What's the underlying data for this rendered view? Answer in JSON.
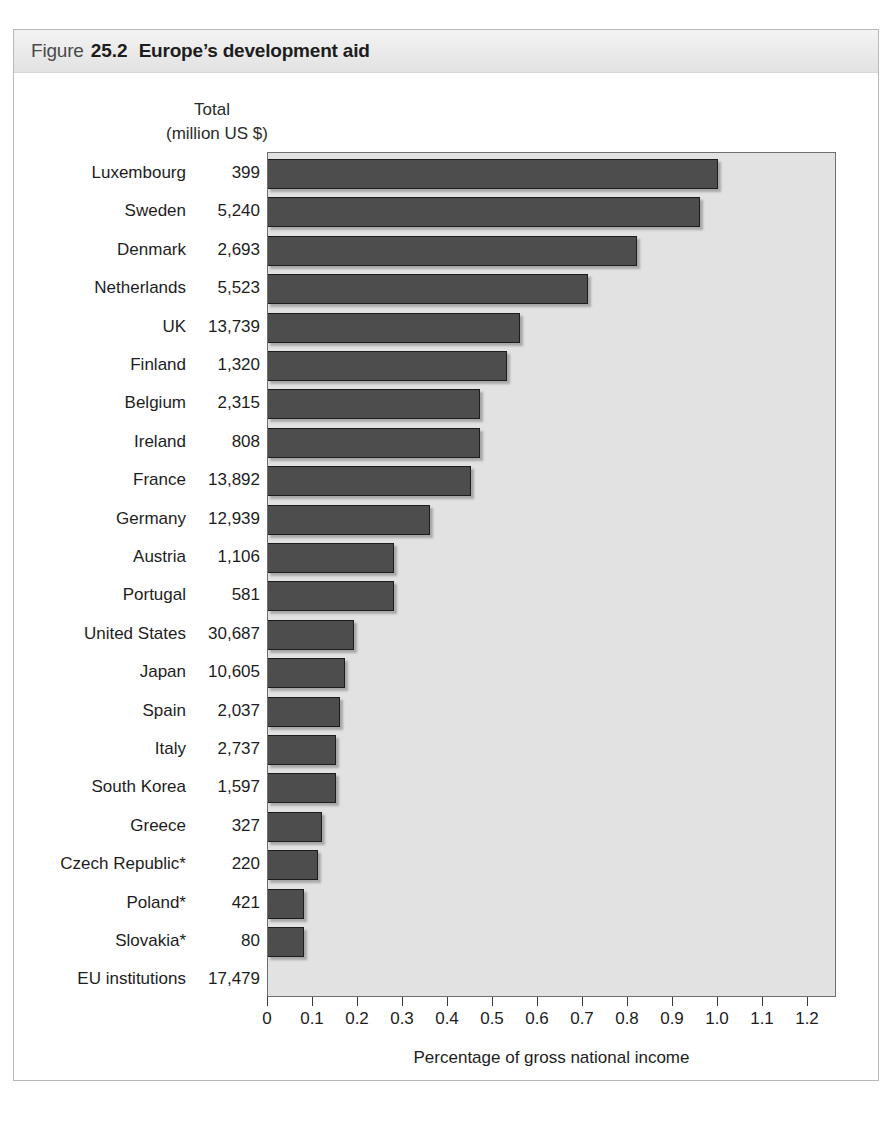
{
  "figure": {
    "label_word": "Figure",
    "number": "25.2",
    "title": "Europe’s development aid"
  },
  "columns": {
    "total_heading_line1": "Total",
    "total_heading_line2": "(million US $)"
  },
  "colors": {
    "bar_fill": "#4d4d4d",
    "bar_border": "#1c1c1c",
    "plot_background": "#e2e2e2",
    "header_band": "#eaeaea",
    "frame_border": "#b9b9b9"
  },
  "chart_data": {
    "type": "bar",
    "orientation": "horizontal",
    "title": "Europe’s development aid",
    "xlabel": "Percentage of gross national income",
    "ylabel": "",
    "xlim": [
      0,
      1.26
    ],
    "grid": false,
    "legend": null,
    "tick_labels": [
      "0",
      "0.1",
      "0.2",
      "0.3",
      "0.4",
      "0.5",
      "0.6",
      "0.7",
      "0.8",
      "0.9",
      "1.0",
      "1.1",
      "1.2"
    ],
    "tick_values": [
      0,
      0.1,
      0.2,
      0.3,
      0.4,
      0.5,
      0.6,
      0.7,
      0.8,
      0.9,
      1.0,
      1.1,
      1.2
    ],
    "value_column_header": "Total (million US $)",
    "categories": [
      "Luxembourg",
      "Sweden",
      "Denmark",
      "Netherlands",
      "UK",
      "Finland",
      "Belgium",
      "Ireland",
      "France",
      "Germany",
      "Austria",
      "Portugal",
      "United States",
      "Japan",
      "Spain",
      "Italy",
      "South Korea",
      "Greece",
      "Czech Republic*",
      "Poland*",
      "Slovakia*",
      "EU institutions"
    ],
    "values": [
      1.0,
      0.96,
      0.82,
      0.71,
      0.56,
      0.53,
      0.47,
      0.47,
      0.45,
      0.36,
      0.28,
      0.28,
      0.19,
      0.17,
      0.16,
      0.15,
      0.15,
      0.12,
      0.11,
      0.08,
      0.08,
      null
    ],
    "totals": [
      "399",
      "5,240",
      "2,693",
      "5,523",
      "13,739",
      "1,320",
      "2,315",
      "808",
      "13,892",
      "12,939",
      "1,106",
      "581",
      "30,687",
      "10,605",
      "2,037",
      "2,737",
      "1,597",
      "327",
      "220",
      "421",
      "80",
      "17,479"
    ]
  }
}
